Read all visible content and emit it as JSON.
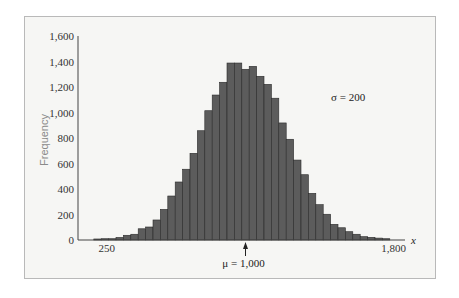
{
  "chart_data": {
    "type": "bar",
    "title": "",
    "xlabel": "x",
    "ylabel": "Frequency",
    "ylim": [
      0,
      1600
    ],
    "xlim": [
      180,
      1860
    ],
    "y_ticks": [
      0,
      200,
      400,
      600,
      800,
      1000,
      1200,
      1400,
      1600
    ],
    "y_tick_labels": [
      "0",
      "200",
      "400",
      "600",
      "800",
      "1,000",
      "1,200",
      "1,400",
      "1,600"
    ],
    "x_tick_labels": [
      {
        "value": 250,
        "label": "250"
      },
      {
        "value": 1800,
        "label": "1,800"
      }
    ],
    "grid": false,
    "bin_width": 40,
    "categories": [
      200,
      240,
      280,
      320,
      360,
      400,
      440,
      480,
      520,
      560,
      600,
      640,
      680,
      720,
      760,
      800,
      840,
      880,
      920,
      960,
      1000,
      1040,
      1080,
      1120,
      1160,
      1200,
      1240,
      1280,
      1320,
      1360,
      1400,
      1440,
      1480,
      1520,
      1560,
      1600,
      1640,
      1680,
      1720,
      1760
    ],
    "values": [
      8,
      10,
      10,
      20,
      37,
      45,
      88,
      102,
      157,
      240,
      345,
      455,
      555,
      680,
      857,
      1014,
      1137,
      1237,
      1388,
      1388,
      1339,
      1362,
      1284,
      1221,
      1112,
      918,
      790,
      627,
      512,
      366,
      277,
      202,
      123,
      96,
      65,
      45,
      26,
      21,
      15,
      10
    ],
    "annotations": [
      {
        "text": "σ = 200",
        "position": "right of peak"
      },
      {
        "text": "μ = 1,000",
        "position": "below x-axis with arrow at 1000"
      }
    ],
    "bar_color": "#5c5c5c",
    "bar_edge_color": "#2a2a2a"
  },
  "labels": {
    "ylabel": "Frequency",
    "xlabel": "x",
    "sigma": "σ = 200",
    "mu": "μ = 1,000"
  }
}
